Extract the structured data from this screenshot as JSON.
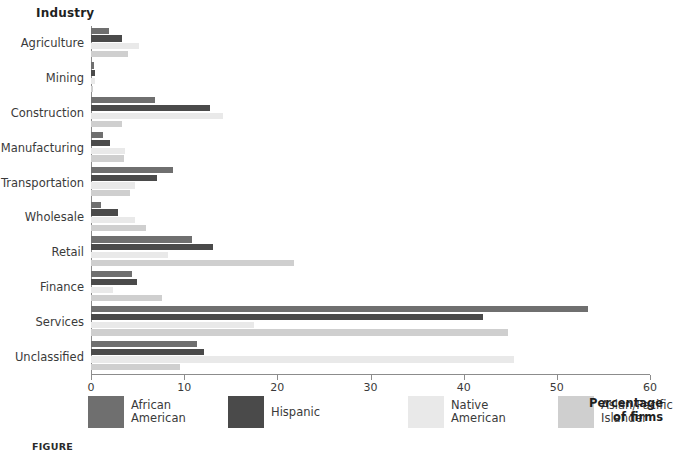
{
  "chart_data": {
    "type": "bar",
    "orientation": "horizontal",
    "title": "",
    "ylabel": "Industry",
    "xlabel": "Percentage\nof firms",
    "xlim": [
      0,
      60
    ],
    "xticks": [
      0,
      10,
      20,
      30,
      40,
      50,
      60
    ],
    "grid": false,
    "legend_position": "bottom",
    "categories": [
      "Agriculture",
      "Mining",
      "Construction",
      "Manufacturing",
      "Transportation",
      "Wholesale",
      "Retail",
      "Finance",
      "Services",
      "Unclassified"
    ],
    "series": [
      {
        "name": "African\nAmerican",
        "color": "#6f6f6f",
        "values": [
          1.9,
          0.3,
          6.9,
          1.3,
          8.8,
          1.1,
          10.8,
          4.4,
          53.3,
          11.4
        ]
      },
      {
        "name": "Hispanic",
        "color": "#4a4a4a",
        "values": [
          3.3,
          0.4,
          12.8,
          2.0,
          7.1,
          2.9,
          13.1,
          4.9,
          42.1,
          12.1
        ]
      },
      {
        "name": "Native\nAmerican",
        "color": "#e9e9e9",
        "values": [
          5.1,
          0.4,
          14.2,
          3.6,
          4.7,
          4.7,
          8.3,
          2.4,
          17.5,
          45.4
        ]
      },
      {
        "name": "Asian/Pacific\nIslander",
        "color": "#cfcfcf",
        "values": [
          4.0,
          0.2,
          3.3,
          3.5,
          4.2,
          5.9,
          21.8,
          7.6,
          44.8,
          9.6
        ]
      }
    ]
  },
  "figure": {
    "caption": "FIGURE"
  },
  "axes": {
    "y_title": "Industry",
    "x_title": "Percentage\nof firms"
  }
}
